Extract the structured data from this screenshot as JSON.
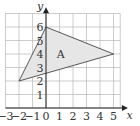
{
  "diagram": {
    "type": "coordinate-grid",
    "x_axis": {
      "label": "x",
      "min": -3,
      "max": 5,
      "ticks": [
        -3,
        -2,
        -1,
        0,
        1,
        2,
        3,
        4,
        5
      ]
    },
    "y_axis": {
      "label": "y",
      "min": 0,
      "max": 6,
      "ticks": [
        1,
        2,
        3,
        4,
        5,
        6
      ]
    },
    "shape": {
      "label": "A",
      "vertices": [
        [
          -2,
          2
        ],
        [
          0,
          6
        ],
        [
          5,
          4
        ]
      ],
      "fill": "#e6e6e6",
      "stroke": "#444444"
    },
    "colors": {
      "grid": "#b8b8b8",
      "axis": "#222222",
      "text": "#333333"
    }
  }
}
